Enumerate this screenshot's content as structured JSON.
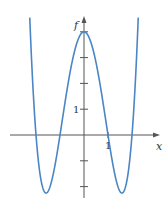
{
  "chart_data": {
    "type": "line",
    "title": "",
    "xlabel": "x",
    "ylabel": "f",
    "x_tick_labels": [
      {
        "value": 1,
        "label": "1"
      }
    ],
    "y_tick_labels": [
      {
        "value": 1,
        "label": "1"
      }
    ],
    "y_ticks": [
      -2,
      -1,
      1,
      2,
      3,
      4
    ],
    "xlim": [
      -3.1,
      3.2
    ],
    "ylim": [
      -2.4,
      4.4
    ],
    "grid": false,
    "legend": null,
    "series": [
      {
        "name": "f",
        "color": "#4a86c5",
        "formula_approx": "x^4 - 5x^2 + 4",
        "x": [
          -2.25,
          -2,
          -1.58,
          -1,
          0,
          1,
          1.58,
          2,
          2.25
        ],
        "y": [
          4.3,
          0,
          -2.25,
          0,
          4,
          0,
          -2.25,
          0,
          4.3
        ]
      }
    ]
  },
  "labels": {
    "x_axis": "x",
    "y_axis": "f",
    "x_one": "1",
    "y_one": "1"
  }
}
